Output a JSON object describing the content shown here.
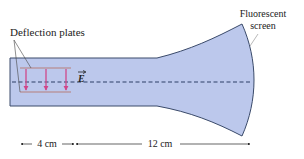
{
  "diagram": {
    "labels": {
      "deflection_plates": "Deflection plates",
      "fluorescent_screen_line1": "Fluorescent",
      "fluorescent_screen_line2": "screen",
      "field_symbol": "E",
      "plate_length": "4 cm",
      "drift_length": "12 cm"
    },
    "colors": {
      "tube_fill": "#bcc8ec",
      "tube_outline": "#3a4a6a",
      "plate_color": "#b9a3b3",
      "field_arrow_color": "#d0478a",
      "axis_color": "#2d3f66",
      "text_color": "#222222"
    },
    "field_arrows_count": 3
  }
}
